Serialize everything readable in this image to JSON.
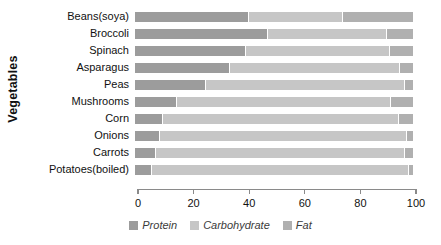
{
  "chart_data": {
    "type": "bar",
    "orientation": "horizontal",
    "stacked": true,
    "title": "",
    "xlabel": "",
    "ylabel": "Vegetables",
    "xlim": [
      0,
      100
    ],
    "xticks": [
      0,
      20,
      40,
      60,
      80,
      100
    ],
    "grid": false,
    "legend_position": "bottom",
    "categories": [
      "Beans(soya)",
      "Broccoli",
      "Spinach",
      "Asparagus",
      "Peas",
      "Mushrooms",
      "Corn",
      "Onions",
      "Carrots",
      "Potatoes(boiled)"
    ],
    "series": [
      {
        "name": "Protein",
        "color": "#9c9c9c",
        "values": [
          41,
          48,
          40,
          34,
          25.5,
          15,
          10,
          9,
          7.5,
          6
        ]
      },
      {
        "name": "Carbohydrate",
        "color": "#c6c6c6",
        "values": [
          34,
          42.6,
          51.7,
          61.3,
          71.5,
          77,
          85,
          89,
          89.5,
          92.5
        ]
      },
      {
        "name": "Fat",
        "color": "#b0b0b0",
        "values": [
          25,
          9.4,
          8.3,
          4.7,
          3,
          8,
          5,
          2,
          3,
          1.5
        ]
      }
    ]
  },
  "axis": {
    "tick_labels": [
      "0",
      "20",
      "40",
      "60",
      "80",
      "100"
    ]
  },
  "legend": {
    "items": [
      {
        "label": "Protein",
        "color": "#9c9c9c"
      },
      {
        "label": "Carbohydrate",
        "color": "#c6c6c6"
      },
      {
        "label": "Fat",
        "color": "#b0b0b0"
      }
    ]
  }
}
